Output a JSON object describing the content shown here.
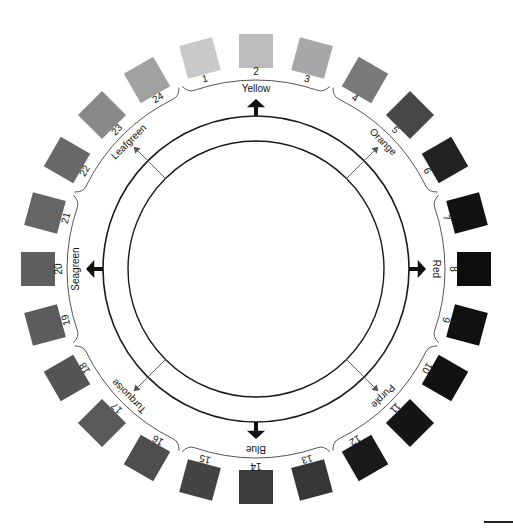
{
  "figure": {
    "type": "color-wheel",
    "center": [
      256,
      269
    ],
    "outer_ring_radius": 153,
    "inner_ring_radius": 128,
    "swatch_radius": 218,
    "number_radius": 197,
    "bracket_radius": 189,
    "label_radius": 178
  },
  "swatches": [
    {
      "n": "1",
      "shade": "#c9c9c9"
    },
    {
      "n": "2",
      "shade": "#bcbcbc"
    },
    {
      "n": "3",
      "shade": "#a7a7a7"
    },
    {
      "n": "4",
      "shade": "#797979"
    },
    {
      "n": "5",
      "shade": "#474747"
    },
    {
      "n": "6",
      "shade": "#222222"
    },
    {
      "n": "7",
      "shade": "#121212"
    },
    {
      "n": "8",
      "shade": "#0d0d0d"
    },
    {
      "n": "9",
      "shade": "#111111"
    },
    {
      "n": "10",
      "shade": "#111111"
    },
    {
      "n": "11",
      "shade": "#151515"
    },
    {
      "n": "12",
      "shade": "#191919"
    },
    {
      "n": "13",
      "shade": "#363636"
    },
    {
      "n": "14",
      "shade": "#3c3c3c"
    },
    {
      "n": "15",
      "shade": "#444444"
    },
    {
      "n": "16",
      "shade": "#4e4e4e"
    },
    {
      "n": "17",
      "shade": "#595959"
    },
    {
      "n": "18",
      "shade": "#545454"
    },
    {
      "n": "19",
      "shade": "#5c5c5c"
    },
    {
      "n": "20",
      "shade": "#5f5f5f"
    },
    {
      "n": "21",
      "shade": "#656565"
    },
    {
      "n": "22",
      "shade": "#686868"
    },
    {
      "n": "23",
      "shade": "#898989"
    },
    {
      "n": "24",
      "shade": "#a1a1a1"
    }
  ],
  "groups": [
    {
      "label": "Yellow",
      "arrow": "bold"
    },
    {
      "label": "Orange",
      "arrow": "thin"
    },
    {
      "label": "Red",
      "arrow": "bold"
    },
    {
      "label": "Purple",
      "arrow": "thin"
    },
    {
      "label": "Blue",
      "arrow": "bold"
    },
    {
      "label": "Turquoise",
      "arrow": "thin"
    },
    {
      "label": "Seagreen",
      "arrow": "bold"
    },
    {
      "label": "Leafgreen",
      "arrow": "thin"
    }
  ]
}
